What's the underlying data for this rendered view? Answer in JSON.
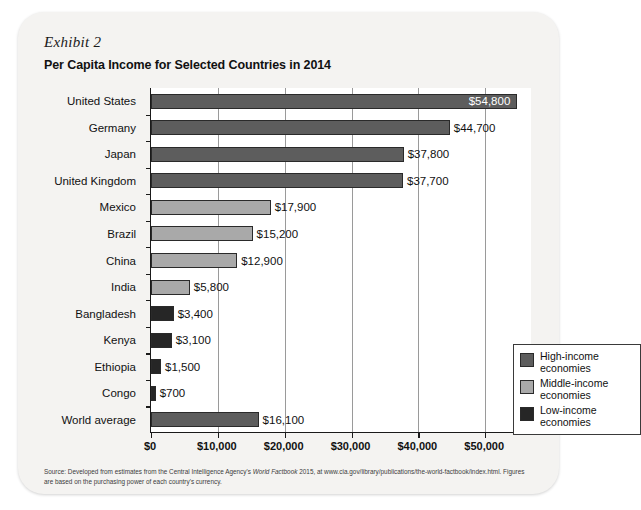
{
  "exhibit": {
    "label": "Exhibit 2",
    "title": "Per Capita Income for Selected Countries in 2014"
  },
  "legend": {
    "items": [
      {
        "label": "High-income\neconomies",
        "line1": "High-income",
        "line2": "economies",
        "color": "#5d5d5d",
        "key": "high"
      },
      {
        "label": "Middle-income\neconomies",
        "line1": "Middle-income",
        "line2": "economies",
        "color": "#a9a9a9",
        "key": "middle"
      },
      {
        "label": "Low-income\neconomies",
        "line1": "Low-income",
        "line2": "economies",
        "color": "#262626",
        "key": "low"
      }
    ]
  },
  "source": {
    "line1_a": "Source: Developed from estimates from the Central Intelligence Agency's ",
    "line1_italic": "World Factbook",
    "line1_b": " 2015, at www.cia.gov/library/publications/the-world-factbook",
    "line2": "/index.html. Figures are based on the purchasing power of each country's currency."
  },
  "chart_data": {
    "type": "bar",
    "orientation": "horizontal",
    "title": "Per Capita Income for Selected Countries in 2014",
    "xlabel": "",
    "ylabel": "",
    "xlim": [
      0,
      57000
    ],
    "xticks": [
      0,
      10000,
      20000,
      30000,
      40000,
      50000
    ],
    "xtick_labels": [
      "$0",
      "$10,000",
      "$20,000",
      "$30,000",
      "$40,000",
      "$50,000"
    ],
    "grid": "vertical",
    "legend_position": "inside-right",
    "categories": [
      "United States",
      "Germany",
      "Japan",
      "United Kingdom",
      "Mexico",
      "Brazil",
      "China",
      "India",
      "Bangladesh",
      "Kenya",
      "Ethiopia",
      "Congo",
      "World average"
    ],
    "values": [
      54800,
      44700,
      37800,
      37700,
      17900,
      15200,
      12900,
      5800,
      3400,
      3100,
      1500,
      700,
      16100
    ],
    "value_labels": [
      "$54,800",
      "$44,700",
      "$37,800",
      "$37,700",
      "$17,900",
      "$15,200",
      "$12,900",
      "$5,800",
      "$3,400",
      "$3,100",
      "$1,500",
      "$700",
      "$16,100"
    ],
    "groups": [
      "high",
      "high",
      "high",
      "high",
      "middle",
      "middle",
      "middle",
      "middle",
      "low",
      "low",
      "low",
      "low",
      "world"
    ],
    "label_inside": [
      true,
      false,
      false,
      false,
      false,
      false,
      false,
      false,
      false,
      false,
      false,
      false,
      false
    ],
    "colors": {
      "high": "#5d5d5d",
      "middle": "#a9a9a9",
      "low": "#262626",
      "world": "#5d5d5d"
    },
    "series": [
      {
        "name": "Per capita income (USD)",
        "values": [
          54800,
          44700,
          37800,
          37700,
          17900,
          15200,
          12900,
          5800,
          3400,
          3100,
          1500,
          700,
          16100
        ]
      }
    ]
  }
}
